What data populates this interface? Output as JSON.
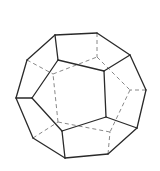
{
  "figure": {
    "colors": {
      "background": "#ffffff",
      "visible_edge": "#2a2a2a",
      "hidden_edge": "#7a7a7a"
    },
    "vertices": {
      "A": [
        55,
        35
      ],
      "B": [
        97,
        33
      ],
      "C": [
        130,
        55
      ],
      "D": [
        146,
        90
      ],
      "E": [
        137,
        128
      ],
      "F": [
        108,
        154
      ],
      "G": [
        65,
        158
      ],
      "H": [
        33,
        138
      ],
      "I": [
        16,
        98
      ],
      "J": [
        27,
        60
      ],
      "K": [
        58,
        60
      ],
      "L": [
        104,
        71
      ],
      "M": [
        106,
        117
      ],
      "N": [
        62,
        131
      ],
      "O": [
        32,
        98
      ],
      "P": [
        97,
        57
      ],
      "Q": [
        130,
        90
      ],
      "R": [
        110,
        132
      ],
      "S": [
        58,
        122
      ],
      "T": [
        53,
        74
      ]
    },
    "solid_edges": [
      [
        "A",
        "B"
      ],
      [
        "B",
        "C"
      ],
      [
        "C",
        "D"
      ],
      [
        "D",
        "E"
      ],
      [
        "E",
        "F"
      ],
      [
        "F",
        "G"
      ],
      [
        "G",
        "H"
      ],
      [
        "H",
        "I"
      ],
      [
        "I",
        "J"
      ],
      [
        "J",
        "A"
      ],
      [
        "K",
        "L"
      ],
      [
        "L",
        "M"
      ],
      [
        "M",
        "N"
      ],
      [
        "N",
        "O"
      ],
      [
        "O",
        "K"
      ],
      [
        "A",
        "K"
      ],
      [
        "C",
        "L"
      ],
      [
        "E",
        "M"
      ],
      [
        "G",
        "N"
      ],
      [
        "I",
        "O"
      ]
    ],
    "hidden_edges": [
      [
        "P",
        "Q"
      ],
      [
        "Q",
        "R"
      ],
      [
        "R",
        "S"
      ],
      [
        "S",
        "T"
      ],
      [
        "T",
        "P"
      ],
      [
        "B",
        "P"
      ],
      [
        "D",
        "Q"
      ],
      [
        "F",
        "R"
      ],
      [
        "H",
        "S"
      ],
      [
        "J",
        "T"
      ]
    ]
  }
}
